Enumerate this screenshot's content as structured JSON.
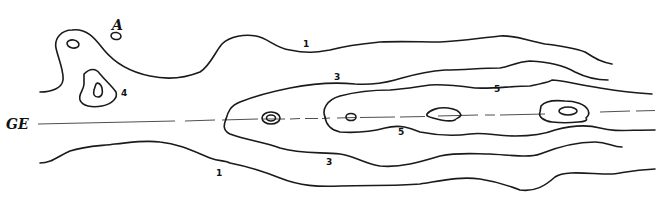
{
  "figure": {
    "type": "contour-diagram",
    "axis_label": "GE",
    "point_label": "A",
    "contour_levels": [
      {
        "id": "l1-top",
        "label": "1"
      },
      {
        "id": "l1-bottom",
        "label": "1"
      },
      {
        "id": "l3-top",
        "label": "3"
      },
      {
        "id": "l3-bottom",
        "label": "3"
      },
      {
        "id": "l4",
        "label": "4"
      },
      {
        "id": "l5-top",
        "label": "5"
      },
      {
        "id": "l5-bottom",
        "label": "5"
      }
    ],
    "colors": {
      "line": "#1a1a1a",
      "background": "#ffffff"
    }
  }
}
